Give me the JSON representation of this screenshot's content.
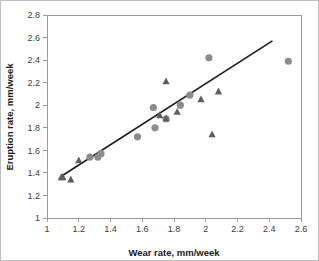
{
  "chart_data": {
    "type": "scatter",
    "title": "",
    "xlabel": "Wear rate, mm/week",
    "ylabel": "Eruption rate, mm/week",
    "xlim": [
      1,
      2.6
    ],
    "ylim": [
      1,
      2.8
    ],
    "xticks": [
      "1",
      "1.2",
      "1.4",
      "1.6",
      "1.8",
      "2",
      "2.2",
      "2.4",
      "2.6"
    ],
    "yticks": [
      "1",
      "1.2",
      "1.4",
      "1.6",
      "1.8",
      "2",
      "2.2",
      "2.4",
      "2.6",
      "2.8"
    ],
    "xtick_values": [
      1,
      1.2,
      1.4,
      1.6,
      1.8,
      2,
      2.2,
      2.4,
      2.6
    ],
    "ytick_values": [
      1,
      1.2,
      1.4,
      1.6,
      1.8,
      2,
      2.2,
      2.4,
      2.6,
      2.8
    ],
    "grid": false,
    "legend": "none",
    "series": [
      {
        "name": "circles",
        "marker": "circle",
        "color": "#8c8c8c",
        "points": [
          [
            1.27,
            1.54
          ],
          [
            1.32,
            1.54
          ],
          [
            1.34,
            1.57
          ],
          [
            1.57,
            1.72
          ],
          [
            1.67,
            1.98
          ],
          [
            1.68,
            1.8
          ],
          [
            1.75,
            1.88
          ],
          [
            1.84,
            2.0
          ],
          [
            1.9,
            2.09
          ],
          [
            2.02,
            2.42
          ],
          [
            2.52,
            2.39
          ]
        ]
      },
      {
        "name": "triangles",
        "marker": "triangle",
        "color": "#5e5e5e",
        "points": [
          [
            1.09,
            1.36
          ],
          [
            1.1,
            1.36
          ],
          [
            1.15,
            1.34
          ],
          [
            1.2,
            1.51
          ],
          [
            1.71,
            1.91
          ],
          [
            1.75,
            2.21
          ],
          [
            1.75,
            1.88
          ],
          [
            1.82,
            1.94
          ],
          [
            1.97,
            2.05
          ],
          [
            2.04,
            1.74
          ],
          [
            2.08,
            2.12
          ]
        ]
      }
    ],
    "trendline": {
      "name": "linear-fit",
      "color": "#1c1c1c",
      "x_start": 1.09,
      "y_start": 1.37,
      "x_end": 2.42,
      "y_end": 2.57
    }
  }
}
